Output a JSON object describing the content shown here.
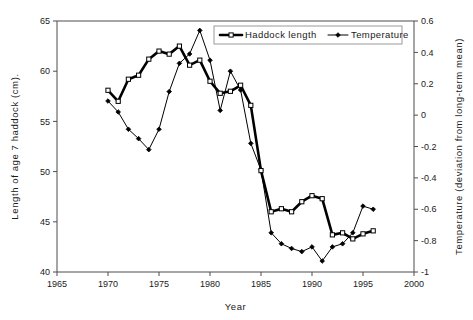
{
  "chart_data": {
    "type": "line",
    "title": "",
    "xlabel": "Year",
    "ylabel": "Length of age 7 haddock (cm).",
    "y2label": "Temperature (deviation from long-term mean)",
    "xlim": [
      1965,
      2000
    ],
    "ylim": [
      40,
      65
    ],
    "y2lim": [
      -1,
      0.6
    ],
    "xticks": [
      "1965",
      "1970",
      "1975",
      "1980",
      "1985",
      "1990",
      "1995",
      "2000"
    ],
    "yticks": [
      "40",
      "45",
      "50",
      "55",
      "60",
      "65"
    ],
    "y2ticks": [
      "-1",
      "-0.8",
      "-0.6",
      "-0.4",
      "-0.2",
      "0",
      "0.2",
      "0.4",
      "0.6"
    ],
    "grid": false,
    "legend_position": "top-center",
    "series": [
      {
        "name": "Haddock length",
        "axis": "left",
        "marker": "open-square",
        "line_width": "thick",
        "color": "#000000",
        "x": [
          1970,
          1971,
          1972,
          1973,
          1974,
          1975,
          1976,
          1977,
          1978,
          1979,
          1980,
          1981,
          1982,
          1983,
          1984,
          1985,
          1986,
          1987,
          1988,
          1989,
          1990,
          1991,
          1992,
          1993,
          1994,
          1995,
          1996
        ],
        "values": [
          58.1,
          57.0,
          59.2,
          59.6,
          61.2,
          62.0,
          61.7,
          62.5,
          60.6,
          61.1,
          59.0,
          57.8,
          58.0,
          58.6,
          56.6,
          50.1,
          46.0,
          46.3,
          46.0,
          47.0,
          47.6,
          47.3,
          43.7,
          43.9,
          43.3,
          43.8,
          44.1
        ]
      },
      {
        "name": "Temperature",
        "axis": "right",
        "marker": "filled-diamond",
        "line_width": "thin",
        "color": "#000000",
        "x": [
          1970,
          1971,
          1972,
          1973,
          1974,
          1975,
          1976,
          1977,
          1978,
          1979,
          1980,
          1981,
          1982,
          1983,
          1984,
          1985,
          1986,
          1987,
          1988,
          1989,
          1990,
          1991,
          1992,
          1993,
          1994,
          1995,
          1996
        ],
        "values": [
          0.09,
          0.02,
          -0.09,
          -0.15,
          -0.22,
          -0.09,
          0.15,
          0.33,
          0.39,
          0.54,
          0.35,
          0.03,
          0.28,
          0.16,
          -0.18,
          -0.35,
          -0.75,
          -0.82,
          -0.85,
          -0.87,
          -0.84,
          -0.93,
          -0.84,
          -0.82,
          -0.75,
          -0.58,
          -0.6
        ]
      }
    ]
  },
  "legend": {
    "items": [
      {
        "label": "Haddock length"
      },
      {
        "label": "Temperature"
      }
    ]
  }
}
